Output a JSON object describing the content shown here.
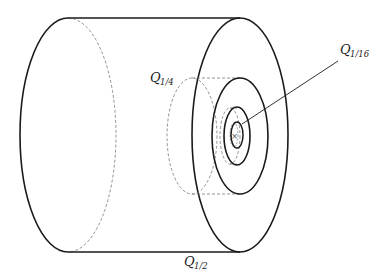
{
  "diagram": {
    "type": "nested-cylinders",
    "colors": {
      "solid": "#1a1a1a",
      "dashed": "#777777",
      "background": "#ffffff"
    },
    "labels": [
      {
        "id": "q_half",
        "base": "Q",
        "sub": "1/2"
      },
      {
        "id": "q_quarter",
        "base": "Q",
        "sub": "1/4"
      },
      {
        "id": "q_sixteenth",
        "base": "Q",
        "sub": "1/16"
      }
    ],
    "center_marker": "×"
  }
}
